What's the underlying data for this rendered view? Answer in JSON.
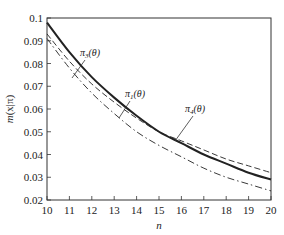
{
  "chart_data": {
    "type": "line",
    "title": "",
    "xlabel": "n",
    "ylabel": "m(x|π)",
    "xlim": [
      10,
      20
    ],
    "ylim": [
      0.02,
      0.1
    ],
    "xticks": [
      10,
      11,
      12,
      13,
      14,
      15,
      16,
      17,
      18,
      19,
      20
    ],
    "yticks": [
      0.02,
      0.03,
      0.04,
      0.05,
      0.06,
      0.07,
      0.08,
      0.09,
      0.1
    ],
    "ytick_labels": [
      "0.02",
      "0.03",
      "0.04",
      "0.05",
      "0.06",
      "0.07",
      "0.08",
      "0.09",
      "0.1"
    ],
    "grid": false,
    "legend": "none (inline annotations)",
    "x": [
      10,
      11,
      12,
      13,
      14,
      15,
      16,
      17,
      18,
      19,
      20
    ],
    "series": [
      {
        "name": "π3(θ)",
        "style": "solid-thick",
        "values": [
          0.098,
          0.085,
          0.074,
          0.065,
          0.057,
          0.05,
          0.045,
          0.04,
          0.036,
          0.032,
          0.029
        ]
      },
      {
        "name": "π4(θ)",
        "style": "dashed",
        "values": [
          0.093,
          0.081,
          0.071,
          0.063,
          0.056,
          0.05,
          0.046,
          0.042,
          0.038,
          0.035,
          0.032
        ]
      },
      {
        "name": "π1(θ)",
        "style": "dash-dot",
        "values": [
          0.091,
          0.078,
          0.067,
          0.058,
          0.05,
          0.044,
          0.039,
          0.034,
          0.03,
          0.027,
          0.024
        ]
      }
    ],
    "annotations": [
      {
        "text": "π3(θ)",
        "sub": "3",
        "x": 11.5,
        "y": 0.085,
        "points_to": "solid-thick"
      },
      {
        "text": "π1(θ)",
        "sub": "1",
        "x": 13.8,
        "y": 0.069,
        "points_to": "solid-thick/dashed intersection"
      },
      {
        "text": "π4(θ)",
        "sub": "4",
        "x": 16.8,
        "y": 0.062,
        "points_to": "dashed"
      }
    ]
  },
  "labels": {
    "xlabel": "n",
    "ylabel_m": "m",
    "ylabel_rest": "(x|π)",
    "pi": "π",
    "theta": "(θ)",
    "sub3": "3",
    "sub1": "1",
    "sub4": "4"
  }
}
